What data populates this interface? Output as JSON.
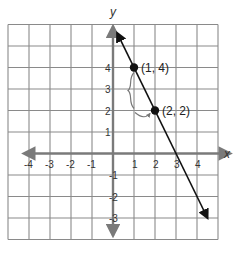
{
  "chart_data": {
    "type": "line",
    "title": "",
    "xlabel": "x",
    "ylabel": "y",
    "xlim": [
      -5,
      5
    ],
    "ylim": [
      -4,
      6
    ],
    "grid": true,
    "x_ticks": [
      -4,
      -3,
      -2,
      -1,
      1,
      2,
      3,
      4
    ],
    "y_ticks": [
      4,
      3,
      2,
      1,
      -1,
      -2,
      -3
    ],
    "x_tick_labels": [
      "-4",
      "-3",
      "-2",
      "-1",
      "1",
      "2",
      "3",
      "4"
    ],
    "y_tick_labels": [
      "4",
      "3",
      "2",
      "1",
      "-1",
      "-2",
      "-3"
    ],
    "series": [
      {
        "name": "line",
        "slope": -2,
        "intercept": 6,
        "x": [
          0.2,
          1,
          2,
          3,
          4.5
        ],
        "y": [
          5.6,
          4,
          2,
          0,
          -3
        ]
      }
    ],
    "points": [
      {
        "x": 1,
        "y": 4,
        "label": "(1, 4)"
      },
      {
        "x": 2,
        "y": 2,
        "label": "(2, 2)"
      }
    ],
    "annotations": [
      {
        "type": "rise-brace",
        "from": [
          1,
          4
        ],
        "to": [
          1,
          2
        ],
        "note": "rise of -2"
      },
      {
        "type": "run-arrow",
        "from": [
          1,
          2
        ],
        "to": [
          2,
          2
        ],
        "note": "run of 1"
      }
    ]
  },
  "colors": {
    "grid": "#8a8a8a",
    "axis": "#7a7a7a",
    "line": "#111111",
    "point": "#111111",
    "annotation": "#777777"
  }
}
